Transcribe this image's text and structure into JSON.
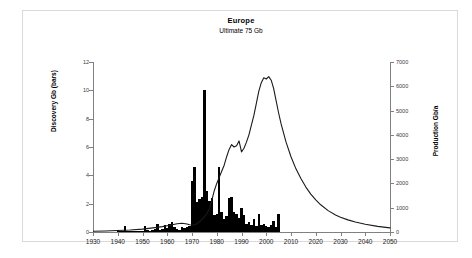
{
  "figure": {
    "title": "Europe",
    "subtitle": "Ultimate  75 Gb",
    "frame_color": "#d9d9d9",
    "background": "#ffffff"
  },
  "chart_data": {
    "type": "bar",
    "title": "Europe",
    "subtitle": "Ultimate  75 Gb",
    "xlabel": "",
    "ylabel": "Discovery Gb (bars)",
    "ylabel_right": "Production Gb/a",
    "xlim": [
      1930,
      2050
    ],
    "ylim": [
      0,
      12
    ],
    "ylim_right": [
      0,
      7000
    ],
    "grid": false,
    "legend": "none",
    "xticks": [
      1930,
      1940,
      1950,
      1960,
      1970,
      1980,
      1990,
      2000,
      2010,
      2020,
      2030,
      2040,
      2050
    ],
    "yticks_left": [
      0,
      2,
      4,
      6,
      8,
      10,
      12
    ],
    "yticks_right": [
      0,
      1000,
      2000,
      3000,
      4000,
      5000,
      6000,
      7000
    ],
    "series": [
      {
        "name": "Discovery Gb (bars)",
        "type": "bar",
        "axis": "left",
        "color": "#000000",
        "x": [
          1930,
          1931,
          1932,
          1933,
          1934,
          1935,
          1936,
          1937,
          1938,
          1939,
          1940,
          1941,
          1942,
          1943,
          1944,
          1945,
          1946,
          1947,
          1948,
          1949,
          1950,
          1951,
          1952,
          1953,
          1954,
          1955,
          1956,
          1957,
          1958,
          1959,
          1960,
          1961,
          1962,
          1963,
          1964,
          1965,
          1966,
          1967,
          1968,
          1969,
          1970,
          1971,
          1972,
          1973,
          1974,
          1975,
          1976,
          1977,
          1978,
          1979,
          1980,
          1981,
          1982,
          1983,
          1984,
          1985,
          1986,
          1987,
          1988,
          1989,
          1990,
          1991,
          1992,
          1993,
          1994,
          1995,
          1996,
          1997,
          1998,
          1999,
          2000,
          2001,
          2002,
          2003,
          2004,
          2005
        ],
        "values": [
          0.0,
          0.0,
          0.0,
          0.0,
          0.0,
          0.0,
          0.0,
          0.0,
          0.0,
          0.0,
          0.05,
          0.05,
          0.05,
          0.45,
          0.1,
          0.05,
          0.05,
          0.05,
          0.05,
          0.05,
          0.1,
          0.4,
          0.15,
          0.1,
          0.15,
          0.2,
          0.55,
          0.15,
          0.2,
          0.5,
          0.25,
          0.6,
          0.7,
          0.35,
          0.2,
          0.15,
          0.35,
          0.3,
          0.35,
          0.4,
          3.6,
          4.6,
          2.1,
          2.3,
          2.5,
          10.0,
          2.9,
          2.2,
          2.4,
          1.2,
          1.3,
          4.6,
          1.4,
          0.9,
          1.1,
          2.4,
          2.5,
          1.4,
          1.3,
          1.0,
          1.7,
          1.2,
          0.6,
          0.7,
          0.5,
          0.9,
          0.4,
          1.3,
          0.5,
          0.6,
          0.45,
          0.35,
          0.5,
          0.75,
          0.35,
          1.3
        ]
      },
      {
        "name": "Production Gb/a",
        "type": "line",
        "axis": "right",
        "color": "#1a1a1a",
        "x": [
          1930,
          1935,
          1940,
          1945,
          1950,
          1955,
          1958,
          1960,
          1962,
          1964,
          1966,
          1968,
          1969,
          1970,
          1971,
          1972,
          1973,
          1974,
          1975,
          1976,
          1977,
          1978,
          1979,
          1980,
          1981,
          1982,
          1983,
          1984,
          1985,
          1986,
          1987,
          1988,
          1989,
          1990,
          1991,
          1992,
          1993,
          1994,
          1995,
          1996,
          1997,
          1998,
          1999,
          2000,
          2001,
          2002,
          2003,
          2004,
          2005,
          2006,
          2008,
          2010,
          2012,
          2014,
          2016,
          2018,
          2020,
          2022,
          2025,
          2028,
          2030,
          2033,
          2036,
          2040,
          2045,
          2050
        ],
        "values": [
          30,
          40,
          60,
          80,
          120,
          180,
          220,
          260,
          300,
          340,
          360,
          330,
          300,
          290,
          300,
          340,
          420,
          520,
          620,
          760,
          950,
          1300,
          1700,
          2000,
          2250,
          2500,
          2750,
          3100,
          3400,
          3600,
          3500,
          3550,
          3750,
          3300,
          3450,
          3700,
          4000,
          4400,
          4800,
          5300,
          5800,
          6150,
          6350,
          6300,
          6400,
          6250,
          5900,
          5400,
          4900,
          4450,
          3700,
          3100,
          2600,
          2200,
          1850,
          1560,
          1320,
          1120,
          880,
          700,
          610,
          500,
          410,
          320,
          230,
          170
        ]
      }
    ]
  },
  "axes": {
    "left": {
      "label": "Discovery Gb (bars)",
      "ticks": [
        "0",
        "2",
        "4",
        "6",
        "8",
        "10",
        "12"
      ]
    },
    "right": {
      "label": "Production Gb/a",
      "ticks": [
        "0",
        "1000",
        "2000",
        "3000",
        "4000",
        "5000",
        "6000",
        "7000"
      ]
    },
    "bottom": {
      "label": "",
      "ticks": [
        "1930",
        "1940",
        "1950",
        "1960",
        "1970",
        "1980",
        "1990",
        "2000",
        "2010",
        "2020",
        "2030",
        "2040",
        "2050"
      ]
    }
  }
}
